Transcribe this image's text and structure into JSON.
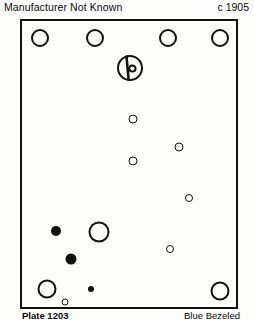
{
  "header": {
    "manufacturer": "Manufacturer Not Known",
    "date": "c 1905"
  },
  "footer": {
    "plate_number": "Plate 1203",
    "material": "Blue Bezeled"
  },
  "plate": {
    "frame_color": "#111111",
    "background_color": "#fdfdfc",
    "width": 218,
    "height": 290
  },
  "hallmark": {
    "name": "makers-mark",
    "cx": 108,
    "cy": 47,
    "r": 13
  },
  "markers": [
    {
      "id": "top-1",
      "style": "hollow",
      "cx": 18,
      "cy": 17,
      "r": 9
    },
    {
      "id": "top-2",
      "style": "hollow",
      "cx": 73,
      "cy": 17,
      "r": 9
    },
    {
      "id": "top-3",
      "style": "hollow",
      "cx": 146,
      "cy": 17,
      "r": 9
    },
    {
      "id": "top-4",
      "style": "hollow",
      "cx": 198,
      "cy": 17,
      "r": 9
    },
    {
      "id": "mid-1",
      "style": "hollow",
      "cx": 111,
      "cy": 98,
      "r": 4.5
    },
    {
      "id": "mid-2",
      "style": "hollow",
      "cx": 157,
      "cy": 126,
      "r": 4.5
    },
    {
      "id": "mid-3",
      "style": "hollow",
      "cx": 111,
      "cy": 140,
      "r": 4.5
    },
    {
      "id": "mid-4",
      "style": "hollow",
      "cx": 167,
      "cy": 177,
      "r": 4
    },
    {
      "id": "low-1",
      "style": "filled",
      "cx": 34,
      "cy": 210,
      "r": 5
    },
    {
      "id": "low-2",
      "style": "hollow",
      "cx": 77,
      "cy": 211,
      "r": 10.5
    },
    {
      "id": "low-3",
      "style": "hollow",
      "cx": 148,
      "cy": 228,
      "r": 4
    },
    {
      "id": "low-4",
      "style": "filled",
      "cx": 49,
      "cy": 238,
      "r": 5.5
    },
    {
      "id": "bot-1",
      "style": "hollow",
      "cx": 25,
      "cy": 268,
      "r": 9.5
    },
    {
      "id": "bot-2",
      "style": "filled",
      "cx": 69,
      "cy": 268,
      "r": 3
    },
    {
      "id": "bot-3",
      "style": "hollow",
      "cx": 43,
      "cy": 281,
      "r": 3.5
    },
    {
      "id": "bot-4",
      "style": "hollow",
      "cx": 198,
      "cy": 270,
      "r": 9.5
    }
  ]
}
